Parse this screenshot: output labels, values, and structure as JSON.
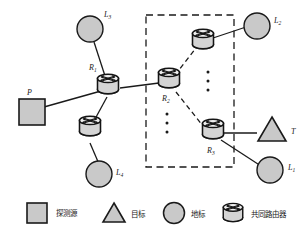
{
  "figure": {
    "type": "network-topology-diagram"
  },
  "nodes": {
    "probe_source": {
      "id": "P",
      "label": "P",
      "shape": "square"
    },
    "target": {
      "id": "T",
      "label": "T",
      "shape": "triangle"
    },
    "landmarks": [
      {
        "id": "L1",
        "label": "L",
        "sub": "1",
        "shape": "circle"
      },
      {
        "id": "L2",
        "label": "L",
        "sub": "2",
        "shape": "circle"
      },
      {
        "id": "L3",
        "label": "L",
        "sub": "3",
        "shape": "circle"
      },
      {
        "id": "L4",
        "label": "L",
        "sub": "4",
        "shape": "circle"
      }
    ],
    "routers": [
      {
        "id": "R1",
        "label": "R",
        "sub": "1",
        "shape": "router"
      },
      {
        "id": "R2",
        "label": "R",
        "sub": "2",
        "shape": "router"
      },
      {
        "id": "R3",
        "label": "R",
        "sub": "3",
        "shape": "router"
      },
      {
        "id": "Ra",
        "label": "",
        "sub": "",
        "shape": "router"
      },
      {
        "id": "Rb",
        "label": "",
        "sub": "",
        "shape": "router"
      }
    ]
  },
  "legend": {
    "items": [
      {
        "icon": "square-icon",
        "label": "探测源"
      },
      {
        "icon": "triangle-icon",
        "label": "目标"
      },
      {
        "icon": "circle-icon",
        "label": "地标"
      },
      {
        "icon": "router-icon",
        "label": "共同路由器"
      }
    ]
  },
  "colors": {
    "fill_gray": "#c9c9c9",
    "stroke_dark": "#1a1a1a",
    "router_body": "#d9d9d9",
    "background": "#ffffff"
  }
}
